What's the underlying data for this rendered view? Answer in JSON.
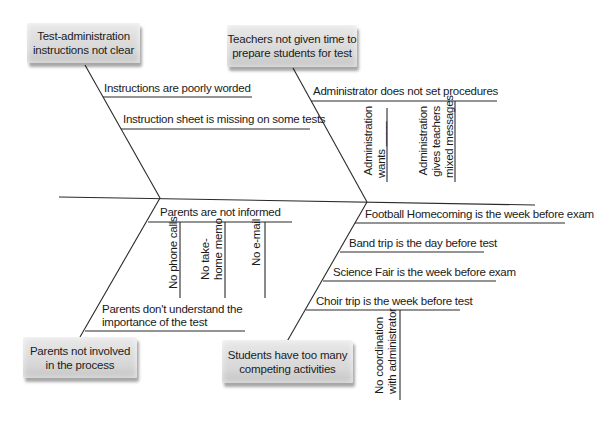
{
  "diagram": {
    "type": "fishbone",
    "categories": [
      {
        "label": "Test-administration\ninstructions not clear",
        "line1": "Test-administration",
        "line2": "instructions not clear",
        "causes": [
          {
            "label": "Instructions are poorly worded"
          },
          {
            "label": "Instruction sheet is missing on some tests"
          }
        ]
      },
      {
        "label": "Teachers not given time to prepare students for test",
        "line1": "Teachers not given time to",
        "line2": "prepare students for test",
        "causes": [
          {
            "label": "Administrator does not set procedures",
            "subcauses": [
              {
                "line1": "Administration",
                "line2": "wants ____"
              },
              {
                "line1": "Administration",
                "line2": "gives teachers",
                "line3": "mixed messages"
              }
            ]
          }
        ]
      },
      {
        "label": "Parents not involved in the process",
        "line1": "Parents not involved",
        "line2": "in the process",
        "causes": [
          {
            "label": "Parents are not informed",
            "subcauses": [
              {
                "line1": "No phone calls"
              },
              {
                "line1": "No take-",
                "line2": "home memo"
              },
              {
                "line1": "No e-mail"
              }
            ]
          },
          {
            "line1": "Parents don't understand the",
            "line2": "importance of the test"
          }
        ]
      },
      {
        "label": "Students have too many competing activities",
        "line1": "Students have too many",
        "line2": "competing activities",
        "causes": [
          {
            "label": "Football Homecoming is the week before exam"
          },
          {
            "label": "Band trip is the day before test"
          },
          {
            "label": "Science Fair is the week before exam"
          },
          {
            "label": "Choir trip is the week before test",
            "subcauses": [
              {
                "line1": "No coordination",
                "line2": "with administrator"
              }
            ]
          }
        ]
      }
    ]
  }
}
